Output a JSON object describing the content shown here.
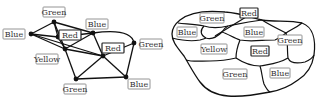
{
  "graph": {
    "nodes": [
      {
        "id": "n_green_top",
        "label": "Green",
        "x": 54,
        "y": 22,
        "lx": 54,
        "ly": 12,
        "lw": 24
      },
      {
        "id": "n_blue_left",
        "label": "Blue",
        "x": 31,
        "y": 34,
        "lx": 14,
        "ly": 34,
        "lw": 20
      },
      {
        "id": "n_red_center",
        "label": "Red",
        "x": 58,
        "y": 37,
        "lx": 70,
        "ly": 35,
        "lw": 18,
        "dark": true
      },
      {
        "id": "n_blue_topright",
        "label": "Blue",
        "x": 93,
        "y": 33,
        "lx": 97,
        "ly": 24,
        "lw": 20
      },
      {
        "id": "n_yellow",
        "label": "Yellow",
        "x": 65,
        "y": 49,
        "lx": 47,
        "ly": 59,
        "lw": 26
      },
      {
        "id": "n_red_mid",
        "label": "Red",
        "x": 103,
        "y": 56,
        "lx": 113,
        "ly": 48,
        "lw": 18,
        "dark": true
      },
      {
        "id": "n_green_right",
        "label": "Green",
        "x": 134,
        "y": 43,
        "lx": 151,
        "ly": 44,
        "lw": 24
      },
      {
        "id": "n_green_bottom",
        "label": "Green",
        "x": 76,
        "y": 79,
        "lx": 75,
        "ly": 89,
        "lw": 24
      },
      {
        "id": "n_blue_bottomright",
        "label": "Blue",
        "x": 126,
        "y": 77,
        "lx": 139,
        "ly": 84,
        "lw": 20
      }
    ],
    "edges": [
      [
        "n_blue_left",
        "n_green_top"
      ],
      [
        "n_blue_left",
        "n_red_center"
      ],
      [
        "n_blue_left",
        "n_yellow"
      ],
      [
        "n_blue_left",
        "n_red_mid"
      ],
      [
        "n_green_top",
        "n_red_center"
      ],
      [
        "n_green_top",
        "n_yellow"
      ],
      [
        "n_green_top",
        "n_blue_topright"
      ],
      [
        "n_red_center",
        "n_blue_topright"
      ],
      [
        "n_red_center",
        "n_yellow"
      ],
      [
        "n_yellow",
        "n_blue_topright"
      ],
      [
        "n_yellow",
        "n_green_bottom"
      ],
      [
        "n_yellow",
        "n_red_mid"
      ],
      [
        "n_blue_topright",
        "n_red_mid"
      ],
      [
        "n_red_mid",
        "n_green_right"
      ],
      [
        "n_red_mid",
        "n_green_bottom"
      ],
      [
        "n_red_mid",
        "n_blue_bottomright"
      ],
      [
        "n_green_right",
        "n_blue_bottomright"
      ],
      [
        "n_green_bottom",
        "n_blue_bottomright"
      ]
    ],
    "curved_edges": [
      {
        "from": "n_blue_topright",
        "to": "n_green_right",
        "path": "M93,33 C115,30 132,32 134,43"
      }
    ]
  },
  "map": {
    "labels": [
      {
        "label": "Green",
        "x": 212,
        "y": 18,
        "w": 24
      },
      {
        "label": "Red",
        "x": 249,
        "y": 13,
        "w": 18,
        "dark": true
      },
      {
        "label": "Blue",
        "x": 187,
        "y": 32,
        "w": 20
      },
      {
        "label": "Blue",
        "x": 254,
        "y": 32,
        "w": 20
      },
      {
        "label": "Green",
        "x": 290,
        "y": 40,
        "w": 24
      },
      {
        "label": "Yellow",
        "x": 214,
        "y": 49,
        "w": 26
      },
      {
        "label": "Red",
        "x": 260,
        "y": 51,
        "w": 18,
        "dark": true
      },
      {
        "label": "Green",
        "x": 235,
        "y": 74,
        "w": 24
      },
      {
        "label": "Blue",
        "x": 280,
        "y": 73,
        "w": 20
      }
    ]
  }
}
